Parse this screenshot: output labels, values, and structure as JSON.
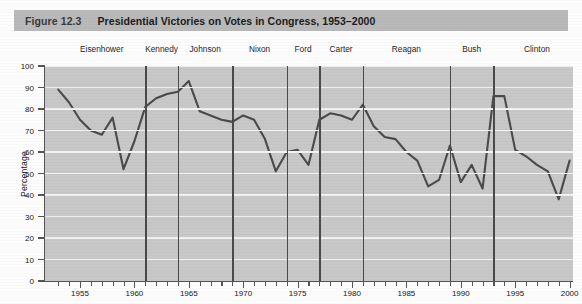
{
  "figure": {
    "number": "Figure 12.3",
    "title": "Presidential Victories on Votes in Congress, 1953–2000"
  },
  "chart_data": {
    "type": "line",
    "title": "Presidential Victories on Votes in Congress, 1953–2000",
    "xlabel": "",
    "ylabel": "Percentage",
    "xlim": [
      1952,
      2000
    ],
    "ylim": [
      0,
      100
    ],
    "grid": true,
    "legend": "none",
    "y_ticks": [
      0,
      10,
      20,
      30,
      40,
      50,
      60,
      70,
      80,
      90,
      100
    ],
    "x_ticks_major": [
      1955,
      1960,
      1965,
      1970,
      1975,
      1980,
      1985,
      1990,
      1995,
      2000
    ],
    "x_tick_minor_step": 1,
    "x": [
      1953,
      1954,
      1955,
      1956,
      1957,
      1958,
      1959,
      1960,
      1961,
      1962,
      1963,
      1964,
      1965,
      1966,
      1967,
      1968,
      1969,
      1970,
      1971,
      1972,
      1973,
      1974,
      1975,
      1976,
      1977,
      1978,
      1979,
      1980,
      1981,
      1982,
      1983,
      1984,
      1985,
      1986,
      1987,
      1988,
      1989,
      1990,
      1991,
      1992,
      1993,
      1994,
      1995,
      1996,
      1997,
      1998,
      1999,
      2000
    ],
    "values": [
      89,
      83,
      75,
      70,
      68,
      76,
      52,
      65,
      81,
      85,
      87,
      88,
      93,
      79,
      77,
      75,
      74,
      77,
      75,
      66,
      51,
      60,
      61,
      54,
      75,
      78,
      77,
      75,
      82,
      72,
      67,
      66,
      60,
      56,
      44,
      47,
      63,
      46,
      54,
      43,
      86,
      86,
      61,
      58,
      54,
      51,
      38,
      56
    ],
    "series_name": "Presidential victories on congressional votes (%)",
    "annotations": [
      {
        "label": "Eisenhower",
        "start": 1953,
        "end": 1961
      },
      {
        "label": "Kennedy",
        "start": 1961,
        "end": 1964
      },
      {
        "label": "Johnson",
        "start": 1964,
        "end": 1969
      },
      {
        "label": "Nixon",
        "start": 1969,
        "end": 1974
      },
      {
        "label": "Ford",
        "start": 1974,
        "end": 1977
      },
      {
        "label": "Carter",
        "start": 1977,
        "end": 1981
      },
      {
        "label": "Reagan",
        "start": 1981,
        "end": 1989
      },
      {
        "label": "Bush",
        "start": 1989,
        "end": 1993
      },
      {
        "label": "Clinton",
        "start": 1993,
        "end": 2001
      }
    ]
  },
  "colors": {
    "title_band": "#b9b9b9",
    "plot_background": "#c8c8c8",
    "gridline": "#f2f2f2",
    "line": "#4a4a4a",
    "divider": "#4a4a4a",
    "axis": "#555555",
    "text": "#1c1c1c"
  }
}
